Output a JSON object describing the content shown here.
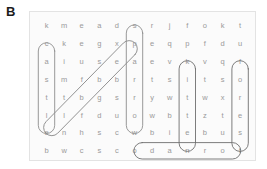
{
  "panel": {
    "label": "B"
  },
  "puzzle": {
    "type": "word-search-grid",
    "rows": 8,
    "cols": 12,
    "letters": [
      [
        "k",
        "m",
        "e",
        "a",
        "d",
        "s",
        "r",
        "j",
        "f",
        "o",
        "k",
        "t"
      ],
      [
        "c",
        "k",
        "e",
        "g",
        "x",
        "p",
        "e",
        "q",
        "p",
        "f",
        "d",
        "u"
      ],
      [
        "a",
        "i",
        "u",
        "s",
        "e",
        "a",
        "e",
        "v",
        "k",
        "v",
        "q",
        "f"
      ],
      [
        "s",
        "m",
        "f",
        "b",
        "b",
        "r",
        "t",
        "s",
        "i",
        "t",
        "s",
        "o"
      ],
      [
        "t",
        "t",
        "b",
        "g",
        "s",
        "r",
        "y",
        "w",
        "t",
        "w",
        "x",
        "r"
      ],
      [
        "l",
        "l",
        "f",
        "d",
        "u",
        "o",
        "w",
        "b",
        "t",
        "z",
        "t",
        "e"
      ],
      [
        "e",
        "n",
        "h",
        "s",
        "c",
        "w",
        "b",
        "i",
        "e",
        "b",
        "u",
        "s"
      ],
      [
        "b",
        "w",
        "c",
        "s",
        "c",
        "o",
        "d",
        "a",
        "n",
        "r",
        "o",
        "t"
      ]
    ],
    "found_words": [
      {
        "name": "castle",
        "text": "castle",
        "orientation": "vertical",
        "start_row": 2,
        "start_col": 1,
        "end_row": 7,
        "end_col": 1,
        "stroke": "#8d8d8d"
      },
      {
        "name": "sparrow",
        "text": "sparrow",
        "orientation": "vertical",
        "start_row": 1,
        "start_col": 6,
        "end_row": 7,
        "end_col": 6,
        "stroke": "#8d8d8d"
      },
      {
        "name": "kitten",
        "text": "kitten",
        "orientation": "vertical",
        "start_row": 3,
        "start_col": 9,
        "end_row": 8,
        "end_col": 9,
        "stroke": "#6e6e6e"
      },
      {
        "name": "forest",
        "text": "forest",
        "orientation": "vertical",
        "start_row": 3,
        "start_col": 12,
        "end_row": 8,
        "end_col": 12,
        "stroke": "#6e6e6e"
      },
      {
        "name": "dragon-diagonal",
        "text": "dragon",
        "orientation": "diagonal",
        "start_row": 2,
        "start_col": 6,
        "end_row": 7,
        "end_col": 1,
        "stroke": "#8d8d8d"
      },
      {
        "name": "odanrot",
        "text": "odanrot",
        "orientation": "horizontal",
        "start_row": 8,
        "start_col": 6,
        "end_row": 8,
        "end_col": 12,
        "stroke": "#6e6e6e"
      }
    ]
  },
  "colors": {
    "letter": "#9a9a9a",
    "panel_label": "#1b1b1b",
    "frame_border": "#e3e3e3",
    "frame_fill": "#fbfbfb",
    "mark_light": "#8d8d8d",
    "mark_dark": "#6e6e6e"
  }
}
